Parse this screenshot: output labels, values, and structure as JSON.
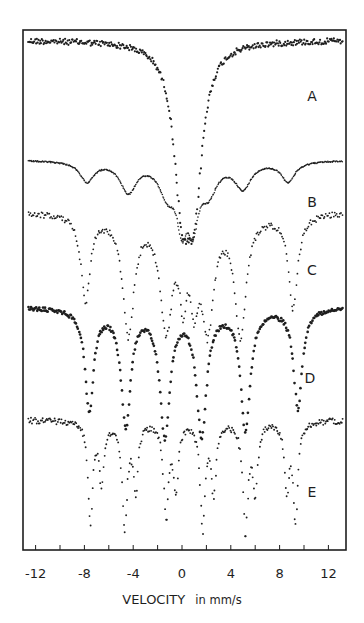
{
  "chart_data": {
    "type": "scatter",
    "title": "",
    "xlabel": "VELOCITY",
    "xlabel_unit": "in mm/s",
    "ylabel": "",
    "xlim": [
      -13,
      13.5
    ],
    "x_ticks": [
      -12,
      -10,
      -8,
      -6,
      -4,
      -2,
      0,
      2,
      4,
      6,
      8,
      10,
      12
    ],
    "x_tick_labels": [
      "-12",
      "-8",
      "-4",
      "0",
      "4",
      "8",
      "12"
    ],
    "x_tick_label_values": [
      -12,
      -8,
      -4,
      0,
      4,
      8,
      12
    ],
    "grid": false,
    "legend": "none (curves labeled A–E at right)",
    "series": [
      {
        "name": "A",
        "label": "A",
        "description": "broad single absorption (doublet) centered near 0.5 mm/s",
        "baseline_y_px": 40,
        "baseline_slope": 0,
        "lines": [
          {
            "v": 0.0,
            "depth": 140,
            "width": 1.6
          },
          {
            "v": 1.0,
            "depth": 140,
            "width": 1.6
          }
        ],
        "marker_size": 1.1,
        "noise": 3,
        "step": 0.07,
        "label_pos": [
          312,
          101
        ]
      },
      {
        "name": "B",
        "label": "B",
        "description": "broadened magnetic sextet with central doublet",
        "baseline_y_px": 160,
        "baseline_slope": 0.9,
        "lines": [
          {
            "v": -7.8,
            "depth": 20,
            "width": 1.4
          },
          {
            "v": -4.4,
            "depth": 30,
            "width": 1.6
          },
          {
            "v": -1.2,
            "depth": 30,
            "width": 1.6
          },
          {
            "v": 0.0,
            "depth": 55,
            "width": 1.0
          },
          {
            "v": 0.9,
            "depth": 55,
            "width": 1.0
          },
          {
            "v": 2.2,
            "depth": 28,
            "width": 1.6
          },
          {
            "v": 5.0,
            "depth": 26,
            "width": 1.6
          },
          {
            "v": 8.7,
            "depth": 20,
            "width": 1.4
          }
        ],
        "marker_size": 0.8,
        "noise": 0.6,
        "step": 0.06,
        "label_pos": [
          312,
          207
        ]
      },
      {
        "name": "C",
        "label": "C",
        "description": "magnetic sextet with central doublet",
        "baseline_y_px": 212,
        "baseline_slope": 0,
        "lines": [
          {
            "v": -7.9,
            "depth": 85,
            "width": 0.9
          },
          {
            "v": -4.4,
            "depth": 120,
            "width": 1.1
          },
          {
            "v": -1.3,
            "depth": 110,
            "width": 1.2
          },
          {
            "v": 0.1,
            "depth": 70,
            "width": 0.7
          },
          {
            "v": 1.0,
            "depth": 70,
            "width": 0.7
          },
          {
            "v": 2.1,
            "depth": 110,
            "width": 1.2
          },
          {
            "v": 4.8,
            "depth": 120,
            "width": 1.1
          },
          {
            "v": 9.1,
            "depth": 95,
            "width": 0.9
          }
        ],
        "marker_size": 0.9,
        "noise": 3,
        "step": 0.09,
        "label_pos": [
          312,
          275
        ]
      },
      {
        "name": "D",
        "label": "D",
        "description": "well-resolved magnetic sextet",
        "baseline_y_px": 307,
        "baseline_slope": 0,
        "lines": [
          {
            "v": -7.6,
            "depth": 100,
            "width": 0.85
          },
          {
            "v": -4.6,
            "depth": 115,
            "width": 0.95
          },
          {
            "v": -1.4,
            "depth": 125,
            "width": 1.0
          },
          {
            "v": 1.6,
            "depth": 125,
            "width": 1.0
          },
          {
            "v": 5.2,
            "depth": 120,
            "width": 0.95
          },
          {
            "v": 9.5,
            "depth": 100,
            "width": 0.85
          }
        ],
        "marker_size": 1.35,
        "noise": 2,
        "step": 0.08,
        "label_pos": [
          310,
          383
        ]
      },
      {
        "name": "E",
        "label": "E",
        "description": "superposition of two sharp magnetic sextets",
        "baseline_y_px": 420,
        "baseline_slope": 0,
        "lines": [
          {
            "v": -7.5,
            "depth": 100,
            "width": 0.45
          },
          {
            "v": -6.6,
            "depth": 60,
            "width": 0.45
          },
          {
            "v": -4.7,
            "depth": 105,
            "width": 0.5
          },
          {
            "v": -3.8,
            "depth": 70,
            "width": 0.45
          },
          {
            "v": -1.3,
            "depth": 95,
            "width": 0.5
          },
          {
            "v": -0.5,
            "depth": 65,
            "width": 0.45
          },
          {
            "v": 1.7,
            "depth": 105,
            "width": 0.5
          },
          {
            "v": 2.6,
            "depth": 70,
            "width": 0.45
          },
          {
            "v": 5.2,
            "depth": 110,
            "width": 0.5
          },
          {
            "v": 6.0,
            "depth": 70,
            "width": 0.45
          },
          {
            "v": 8.6,
            "depth": 65,
            "width": 0.45
          },
          {
            "v": 9.3,
            "depth": 100,
            "width": 0.45
          }
        ],
        "marker_size": 0.95,
        "noise": 3,
        "step": 0.08,
        "label_pos": [
          312,
          497
        ]
      }
    ]
  },
  "figure": {
    "frame": {
      "left": 23,
      "top": 30,
      "right": 346,
      "bottom": 550
    },
    "x_axis_px": {
      "v_at_zero": 182,
      "px_per_unit": 12.2,
      "label_y": 578
    },
    "axis_title_pos": [
      182,
      604
    ],
    "ink_color": "#1e1e1e",
    "background": "#ffffff"
  }
}
